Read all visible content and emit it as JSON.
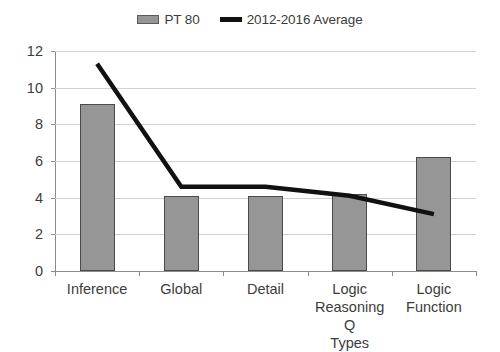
{
  "legend": {
    "entries": [
      {
        "label": "PT 80",
        "marker": "bar-swatch-icon",
        "color": "#969696"
      },
      {
        "label": "2012-2016 Average",
        "marker": "line-swatch-icon",
        "color": "#111111"
      }
    ]
  },
  "axes": {
    "y_ticks": [
      "0",
      "2",
      "4",
      "6",
      "8",
      "10",
      "12"
    ],
    "x_labels": [
      {
        "lines": [
          "Inference"
        ]
      },
      {
        "lines": [
          "Global"
        ]
      },
      {
        "lines": [
          "Detail"
        ]
      },
      {
        "lines": [
          "Logic",
          "Reasoning Q",
          "Types"
        ]
      },
      {
        "lines": [
          "Logic",
          "Function"
        ]
      }
    ]
  },
  "chart_data": {
    "type": "bar",
    "title": "",
    "subtitle": "",
    "xlabel": "",
    "ylabel": "",
    "ylim": [
      0,
      12
    ],
    "ytick_step": 2,
    "grid": true,
    "legend_position": "top-center",
    "categories": [
      "Inference",
      "Global",
      "Detail",
      "Logic Reasoning Q Types",
      "Logic Function"
    ],
    "series": [
      {
        "name": "PT 80",
        "type": "bar",
        "color": "#969696",
        "values": [
          9.1,
          4.1,
          4.1,
          4.2,
          6.2
        ]
      },
      {
        "name": "2012-2016 Average",
        "type": "line",
        "color": "#111111",
        "values": [
          11.3,
          4.6,
          4.6,
          4.1,
          3.1
        ]
      }
    ]
  }
}
